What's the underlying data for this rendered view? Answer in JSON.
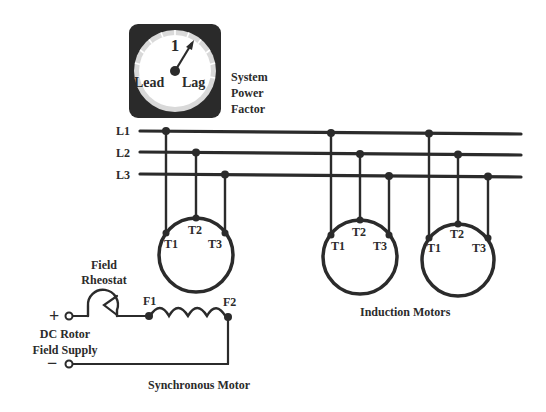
{
  "meter": {
    "title_lines": [
      "System",
      "Power",
      "Factor"
    ],
    "scale_center_label": "1",
    "left_label": "Lead",
    "right_label": "Lag"
  },
  "bus": {
    "lines": [
      "L1",
      "L2",
      "L3"
    ]
  },
  "synchronous_motor": {
    "terminals": [
      "T1",
      "T2",
      "T3"
    ],
    "field_terminals": [
      "F1",
      "F2"
    ],
    "caption": "Synchronous Motor"
  },
  "field_circuit": {
    "rheostat_label_lines": [
      "Field",
      "Rheostat"
    ],
    "supply_label_lines": [
      "DC Rotor",
      "Field Supply"
    ],
    "plus_symbol": "+",
    "minus_symbol": "−"
  },
  "induction_motors": {
    "caption": "Induction Motors",
    "motors": [
      {
        "terminals": [
          "T1",
          "T2",
          "T3"
        ]
      },
      {
        "terminals": [
          "T1",
          "T2",
          "T3"
        ]
      }
    ]
  },
  "colors": {
    "ink": "#2b2b2b",
    "meter_case": "#2a2a2a",
    "dial_face": "#ffffff",
    "dial_rim": "#d9d9d9"
  }
}
